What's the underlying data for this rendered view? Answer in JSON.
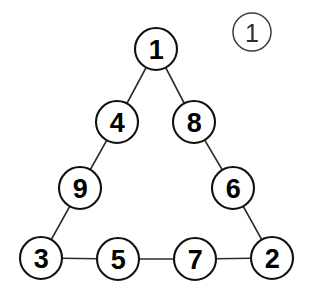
{
  "figure": {
    "background_color": "#ffffff",
    "width": 312,
    "height": 304,
    "node_stroke_color": "#111111",
    "node_fill_color": "#ffffff",
    "edge_color": "#2b2b2b",
    "label_color": "#000000"
  },
  "figure_label": {
    "name": "circled-number-one",
    "text": "1",
    "cx": 252,
    "cy": 32,
    "r": 19,
    "stroke_color": "#3a3a3a",
    "text_color": "#2e2e2e"
  },
  "nodes": [
    {
      "id": "node-1",
      "label": "1",
      "cx": 156,
      "cy": 49,
      "r": 21
    },
    {
      "id": "node-4",
      "label": "4",
      "cx": 117,
      "cy": 122,
      "r": 21
    },
    {
      "id": "node-8",
      "label": "8",
      "cx": 194,
      "cy": 122,
      "r": 21
    },
    {
      "id": "node-9",
      "label": "9",
      "cx": 80,
      "cy": 188,
      "r": 21
    },
    {
      "id": "node-6",
      "label": "6",
      "cx": 233,
      "cy": 188,
      "r": 21
    },
    {
      "id": "node-3",
      "label": "3",
      "cx": 41,
      "cy": 258,
      "r": 21
    },
    {
      "id": "node-5",
      "label": "5",
      "cx": 118,
      "cy": 259,
      "r": 21
    },
    {
      "id": "node-7",
      "label": "7",
      "cx": 195,
      "cy": 259,
      "r": 21
    },
    {
      "id": "node-2",
      "label": "2",
      "cx": 272,
      "cy": 258,
      "r": 21
    }
  ],
  "edges": [
    {
      "id": "edge-1-4",
      "from": "node-1",
      "to": "node-4"
    },
    {
      "id": "edge-1-8",
      "from": "node-1",
      "to": "node-8"
    },
    {
      "id": "edge-4-9",
      "from": "node-4",
      "to": "node-9"
    },
    {
      "id": "edge-8-6",
      "from": "node-8",
      "to": "node-6"
    },
    {
      "id": "edge-9-3",
      "from": "node-9",
      "to": "node-3"
    },
    {
      "id": "edge-6-2",
      "from": "node-6",
      "to": "node-2"
    },
    {
      "id": "edge-3-5",
      "from": "node-3",
      "to": "node-5"
    },
    {
      "id": "edge-5-7",
      "from": "node-5",
      "to": "node-7"
    },
    {
      "id": "edge-7-2",
      "from": "node-7",
      "to": "node-2"
    }
  ]
}
